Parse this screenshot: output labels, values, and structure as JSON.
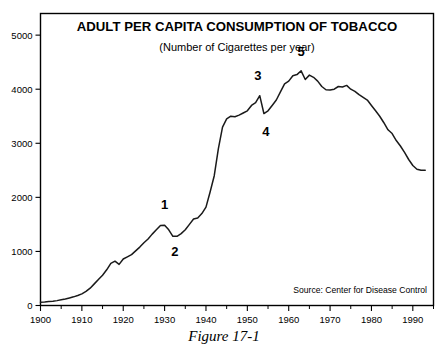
{
  "figure": {
    "caption": "Figure 17-1"
  },
  "chart_data": {
    "type": "line",
    "title": "ADULT PER CAPITA CONSUMPTION OF TOBACCO",
    "subtitle": "(Number of Cigarettes per year)",
    "xlabel": "",
    "ylabel": "",
    "xlim": [
      1900,
      1995
    ],
    "ylim": [
      0,
      5400
    ],
    "grid": false,
    "legend": null,
    "source": "Source: Center for Disease Control",
    "ytick_labels": [
      "0",
      "1000",
      "2000",
      "3000",
      "4000",
      "5000"
    ],
    "yticks": [
      0,
      1000,
      2000,
      3000,
      4000,
      5000
    ],
    "xtick_labels": [
      "1900",
      "1910",
      "1920",
      "1930",
      "1940",
      "1950",
      "1960",
      "1970",
      "1980",
      "1990"
    ],
    "xticks": [
      1900,
      1910,
      1920,
      1930,
      1940,
      1950,
      1960,
      1970,
      1980,
      1990
    ],
    "xminor_step": 5,
    "x": [
      1900,
      1901,
      1902,
      1903,
      1904,
      1905,
      1906,
      1907,
      1908,
      1909,
      1910,
      1911,
      1912,
      1913,
      1914,
      1915,
      1916,
      1917,
      1918,
      1919,
      1920,
      1921,
      1922,
      1923,
      1924,
      1925,
      1926,
      1927,
      1928,
      1929,
      1930,
      1931,
      1932,
      1933,
      1934,
      1935,
      1936,
      1937,
      1938,
      1939,
      1940,
      1941,
      1942,
      1943,
      1944,
      1945,
      1946,
      1947,
      1948,
      1949,
      1950,
      1951,
      1952,
      1953,
      1954,
      1955,
      1956,
      1957,
      1958,
      1959,
      1960,
      1961,
      1962,
      1963,
      1964,
      1965,
      1966,
      1967,
      1968,
      1969,
      1970,
      1971,
      1972,
      1973,
      1974,
      1975,
      1976,
      1977,
      1978,
      1979,
      1980,
      1981,
      1982,
      1983,
      1984,
      1985,
      1986,
      1987,
      1988,
      1989,
      1990,
      1991,
      1992,
      1993
    ],
    "values": [
      60,
      65,
      72,
      80,
      90,
      105,
      120,
      140,
      160,
      185,
      215,
      260,
      320,
      400,
      480,
      560,
      660,
      780,
      820,
      760,
      860,
      900,
      940,
      1010,
      1080,
      1160,
      1230,
      1320,
      1400,
      1480,
      1485,
      1400,
      1280,
      1280,
      1330,
      1400,
      1500,
      1600,
      1620,
      1700,
      1820,
      2100,
      2400,
      2900,
      3300,
      3450,
      3500,
      3490,
      3520,
      3560,
      3600,
      3700,
      3750,
      3880,
      3550,
      3600,
      3700,
      3800,
      3950,
      4100,
      4150,
      4250,
      4270,
      4340,
      4180,
      4260,
      4220,
      4150,
      4050,
      3990,
      3985,
      4000,
      4050,
      4040,
      4070,
      4000,
      3960,
      3900,
      3850,
      3800,
      3700,
      3600,
      3500,
      3380,
      3250,
      3180,
      3050,
      2950,
      2830,
      2700,
      2590,
      2520,
      2500,
      2500
    ],
    "annotations": [
      {
        "id": "1",
        "label": "1",
        "x": 1930,
        "y": 1485,
        "dx": 0,
        "dy": -16,
        "note": "peak before Depression dip"
      },
      {
        "id": "2",
        "label": "2",
        "x": 1932,
        "y": 1280,
        "dx": 2,
        "dy": 20,
        "note": "Depression low"
      },
      {
        "id": "3",
        "label": "3",
        "x": 1953,
        "y": 3880,
        "dx": -2,
        "dy": -16,
        "note": "peak before first cancer reports"
      },
      {
        "id": "4",
        "label": "4",
        "x": 1954,
        "y": 3550,
        "dx": 2,
        "dy": 22,
        "note": "dip after cancer reports"
      },
      {
        "id": "5",
        "label": "5",
        "x": 1963,
        "y": 4340,
        "dx": 0,
        "dy": -15,
        "note": "all-time high before Surgeon General report"
      }
    ]
  }
}
